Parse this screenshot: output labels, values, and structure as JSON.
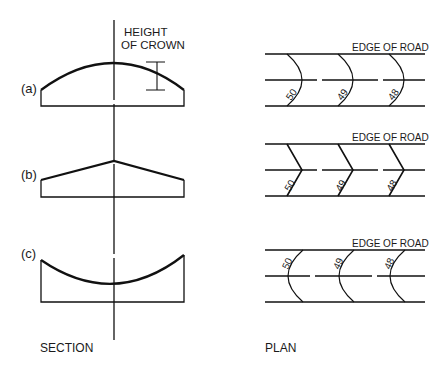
{
  "section": {
    "title": "SECTION",
    "crown_label_line1": "HEIGHT",
    "crown_label_line2": "OF CROWN",
    "labels": {
      "a": "(a)",
      "b": "(b)",
      "c": "(c)"
    }
  },
  "plan": {
    "title": "PLAN",
    "edge_label": "EDGE OF ROAD",
    "contours": [
      "50",
      "49",
      "48"
    ]
  },
  "colors": {
    "line": "#111111",
    "background": "#ffffff"
  }
}
